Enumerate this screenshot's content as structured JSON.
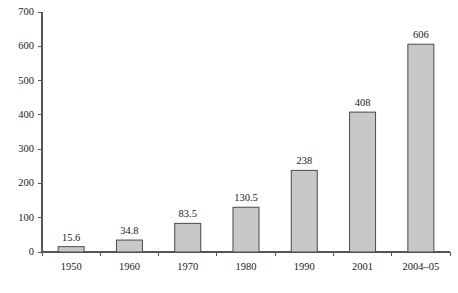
{
  "chart_data": {
    "type": "bar",
    "title": "",
    "subtitle": "",
    "xlabel": "",
    "ylabel": "",
    "categories": [
      "1950",
      "1960",
      "1970",
      "1980",
      "1990",
      "2001",
      "2004–05"
    ],
    "values": [
      15.6,
      34.8,
      83.5,
      130.5,
      238,
      408,
      606
    ],
    "value_labels": [
      "15.6",
      "34.8",
      "83.5",
      "130.5",
      "238",
      "408",
      "606"
    ],
    "ylim": [
      0,
      700
    ],
    "y_ticks": [
      0,
      100,
      200,
      300,
      400,
      500,
      600,
      700
    ],
    "y_tick_labels": [
      "0",
      "100",
      "200",
      "300",
      "400",
      "500",
      "600",
      "700"
    ],
    "grid": false,
    "legend": false,
    "legend_position": "none",
    "bar_fill_color": "#c8c8c8",
    "bar_border_color": "#4a4a4a",
    "axis_color": "#555555",
    "background_color": "#ffffff",
    "data_labels_shown": true,
    "x_tick_style": "between-categories"
  }
}
